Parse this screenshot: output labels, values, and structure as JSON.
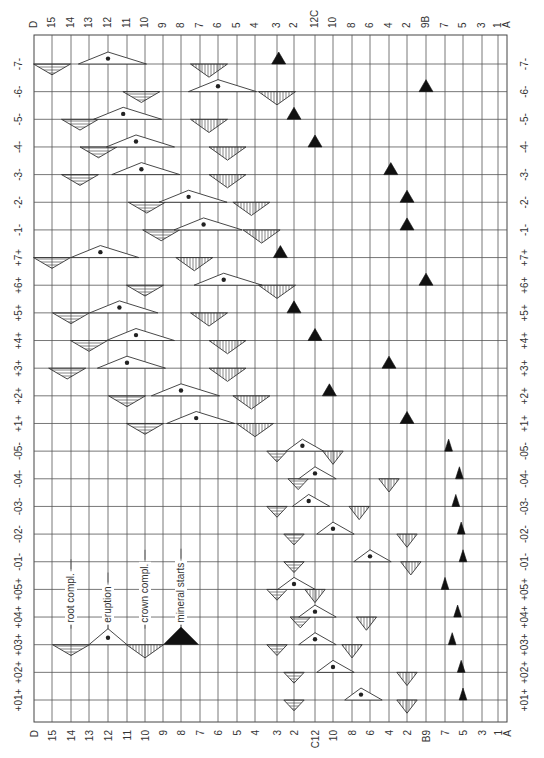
{
  "diagram": {
    "columns_top": [
      "D",
      "15",
      "14",
      "13",
      "12",
      "11",
      "10",
      "9",
      "8",
      "7",
      "6",
      "5",
      "4",
      "3",
      "2",
      "12C",
      "10",
      "8",
      "6",
      "4",
      "2",
      "9B",
      "7",
      "5",
      "3",
      "1",
      "A"
    ],
    "columns_bottom": [
      "D",
      "15",
      "14",
      "13",
      "12",
      "11",
      "10",
      "9",
      "8",
      "7",
      "6",
      "5",
      "4",
      "3",
      "2",
      "C12",
      "10",
      "8",
      "6",
      "4",
      "2",
      "B9",
      "7",
      "5",
      "3",
      "1",
      "A"
    ],
    "rows_left": [
      "-7-",
      "-6-",
      "-5-",
      "-4-",
      "-3-",
      "-2-",
      "-1-",
      "+7+",
      "+6+",
      "+5+",
      "+4+",
      "+3+",
      "+2+",
      "+1+",
      "-05-",
      "-04-",
      "-03-",
      "-02-",
      "-01-",
      "+05+",
      "+04+",
      "+03+",
      "+02+",
      "+01+"
    ],
    "rows_right": [
      "-7-",
      "-6-",
      "-5-",
      "-4-",
      "-3-",
      "-2-",
      "-1-",
      "+7+",
      "+6+",
      "+5+",
      "+4+",
      "+3+",
      "+2+",
      "+1+",
      "-05-",
      "-04-",
      "-03-",
      "-02-",
      "-01-",
      "+05+",
      "+04+",
      "+03+",
      "+02+",
      "+01+"
    ],
    "legend": {
      "row": 21,
      "items": [
        {
          "label": "root compl.",
          "col": 2,
          "type": "root"
        },
        {
          "label": "eruption",
          "col": 4,
          "type": "eruption"
        },
        {
          "label": "crown compl.",
          "col": 6,
          "type": "crown"
        },
        {
          "label": "mineral starts",
          "col": 8,
          "type": "mineral"
        }
      ]
    },
    "events": [
      {
        "row": 0,
        "type": "root",
        "col": 1.0
      },
      {
        "row": 0,
        "type": "eruption",
        "col": 4.0
      },
      {
        "row": 0,
        "type": "crown",
        "col": 9.5
      },
      {
        "row": 0,
        "type": "mineral",
        "col": 13.1
      },
      {
        "row": 1,
        "type": "root",
        "col": 5.8
      },
      {
        "row": 1,
        "type": "eruption",
        "col": 10.0
      },
      {
        "row": 1,
        "type": "crown",
        "col": 13.0
      },
      {
        "row": 1,
        "type": "mineral",
        "col": 21.0
      },
      {
        "row": 2,
        "type": "root",
        "col": 2.5
      },
      {
        "row": 2,
        "type": "eruption",
        "col": 4.8
      },
      {
        "row": 2,
        "type": "crown",
        "col": 9.5
      },
      {
        "row": 2,
        "type": "mineral",
        "col": 14.0
      },
      {
        "row": 3,
        "type": "root",
        "col": 3.5
      },
      {
        "row": 3,
        "type": "eruption",
        "col": 5.5
      },
      {
        "row": 3,
        "type": "crown",
        "col": 10.5
      },
      {
        "row": 3,
        "type": "mineral",
        "col": 15.0
      },
      {
        "row": 4,
        "type": "root",
        "col": 2.5
      },
      {
        "row": 4,
        "type": "eruption",
        "col": 5.8
      },
      {
        "row": 4,
        "type": "crown",
        "col": 10.5
      },
      {
        "row": 4,
        "type": "mineral",
        "col": 19.1
      },
      {
        "row": 5,
        "type": "root",
        "col": 6.1
      },
      {
        "row": 5,
        "type": "eruption",
        "col": 8.4
      },
      {
        "row": 5,
        "type": "crown",
        "col": 11.8
      },
      {
        "row": 5,
        "type": "mineral",
        "col": 20.0
      },
      {
        "row": 6,
        "type": "root",
        "col": 6.9
      },
      {
        "row": 6,
        "type": "eruption",
        "col": 9.2
      },
      {
        "row": 6,
        "type": "crown",
        "col": 12.3
      },
      {
        "row": 6,
        "type": "mineral",
        "col": 20.0
      },
      {
        "row": 7,
        "type": "root",
        "col": 1.0
      },
      {
        "row": 7,
        "type": "eruption",
        "col": 3.6
      },
      {
        "row": 7,
        "type": "crown",
        "col": 8.7
      },
      {
        "row": 7,
        "type": "mineral",
        "col": 13.2
      },
      {
        "row": 8,
        "type": "root",
        "col": 6.0
      },
      {
        "row": 8,
        "type": "eruption",
        "col": 10.3
      },
      {
        "row": 8,
        "type": "crown",
        "col": 13.0
      },
      {
        "row": 8,
        "type": "mineral",
        "col": 21.0
      },
      {
        "row": 9,
        "type": "root",
        "col": 2.0
      },
      {
        "row": 9,
        "type": "eruption",
        "col": 4.6
      },
      {
        "row": 9,
        "type": "crown",
        "col": 9.5
      },
      {
        "row": 9,
        "type": "mineral",
        "col": 14.0
      },
      {
        "row": 10,
        "type": "root",
        "col": 3.0
      },
      {
        "row": 10,
        "type": "eruption",
        "col": 5.5
      },
      {
        "row": 10,
        "type": "crown",
        "col": 10.5
      },
      {
        "row": 10,
        "type": "mineral",
        "col": 15.0
      },
      {
        "row": 11,
        "type": "root",
        "col": 1.8
      },
      {
        "row": 11,
        "type": "eruption",
        "col": 5.0
      },
      {
        "row": 11,
        "type": "crown",
        "col": 10.5
      },
      {
        "row": 11,
        "type": "mineral",
        "col": 19.0
      },
      {
        "row": 12,
        "type": "root",
        "col": 5.0
      },
      {
        "row": 12,
        "type": "eruption",
        "col": 8.0
      },
      {
        "row": 12,
        "type": "crown",
        "col": 11.8
      },
      {
        "row": 12,
        "type": "mineral",
        "col": 15.8
      },
      {
        "row": 13,
        "type": "root",
        "col": 6.0
      },
      {
        "row": 13,
        "type": "eruption",
        "col": 8.8
      },
      {
        "row": 13,
        "type": "crown",
        "col": 12.0
      },
      {
        "row": 13,
        "type": "mineral",
        "col": 20.0
      },
      {
        "row": 14,
        "type": "root",
        "col": 13.0
      },
      {
        "row": 14,
        "type": "eruption",
        "col": 14.4
      },
      {
        "row": 14,
        "type": "crown",
        "col": 16.0
      },
      {
        "row": 14,
        "type": "mineral",
        "col": 22.2
      },
      {
        "row": 15,
        "type": "root",
        "col": 14.2
      },
      {
        "row": 15,
        "type": "eruption",
        "col": 15.0
      },
      {
        "row": 15,
        "type": "crown",
        "col": 19.0
      },
      {
        "row": 15,
        "type": "mineral",
        "col": 22.8
      },
      {
        "row": 16,
        "type": "root",
        "col": 13.0
      },
      {
        "row": 16,
        "type": "eruption",
        "col": 14.7
      },
      {
        "row": 16,
        "type": "crown",
        "col": 17.4
      },
      {
        "row": 16,
        "type": "mineral",
        "col": 22.6
      },
      {
        "row": 17,
        "type": "root",
        "col": 14.0
      },
      {
        "row": 17,
        "type": "eruption",
        "col": 16.0
      },
      {
        "row": 17,
        "type": "crown",
        "col": 20.0
      },
      {
        "row": 17,
        "type": "mineral",
        "col": 22.9
      },
      {
        "row": 18,
        "type": "root",
        "col": 14.0
      },
      {
        "row": 18,
        "type": "eruption",
        "col": 18.0
      },
      {
        "row": 18,
        "type": "crown",
        "col": 20.2
      },
      {
        "row": 18,
        "type": "mineral",
        "col": 23.0
      },
      {
        "row": 19,
        "type": "root",
        "col": 13.0
      },
      {
        "row": 19,
        "type": "eruption",
        "col": 14.0
      },
      {
        "row": 19,
        "type": "crown",
        "col": 15.0
      },
      {
        "row": 19,
        "type": "mineral",
        "col": 22.0
      },
      {
        "row": 20,
        "type": "root",
        "col": 14.3
      },
      {
        "row": 20,
        "type": "eruption",
        "col": 15.0
      },
      {
        "row": 20,
        "type": "crown",
        "col": 17.8
      },
      {
        "row": 20,
        "type": "mineral",
        "col": 22.7
      },
      {
        "row": 21,
        "type": "root",
        "col": 13.0
      },
      {
        "row": 21,
        "type": "eruption",
        "col": 15.0
      },
      {
        "row": 21,
        "type": "crown",
        "col": 17.0
      },
      {
        "row": 21,
        "type": "mineral",
        "col": 22.4
      },
      {
        "row": 22,
        "type": "root",
        "col": 14.0
      },
      {
        "row": 22,
        "type": "eruption",
        "col": 16.0
      },
      {
        "row": 22,
        "type": "crown",
        "col": 20.0
      },
      {
        "row": 22,
        "type": "mineral",
        "col": 22.9
      },
      {
        "row": 23,
        "type": "root",
        "col": 14.0
      },
      {
        "row": 23,
        "type": "eruption",
        "col": 17.5
      },
      {
        "row": 23,
        "type": "crown",
        "col": 20.0
      },
      {
        "row": 23,
        "type": "mineral",
        "col": 23.0
      }
    ]
  }
}
